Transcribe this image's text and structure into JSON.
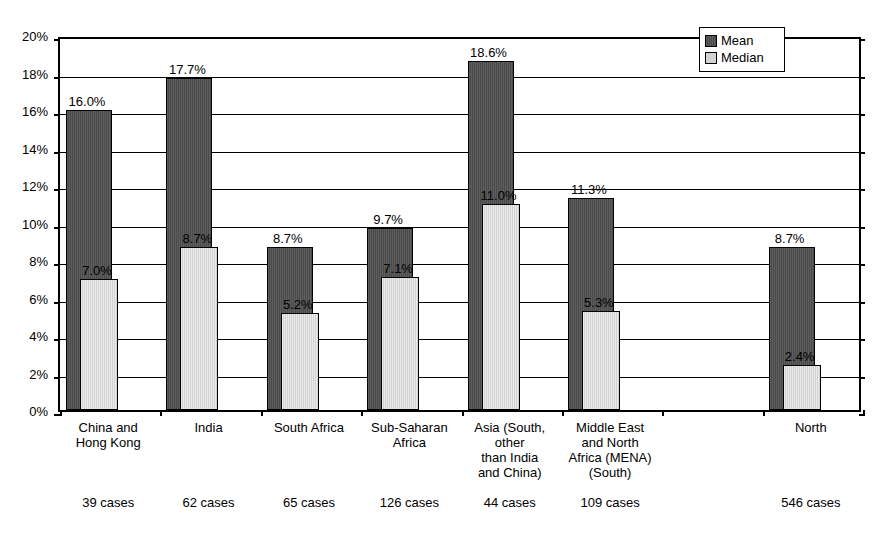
{
  "chart_data": {
    "type": "bar",
    "title": "",
    "xlabel": "",
    "ylabel": "",
    "ylim": [
      0,
      20
    ],
    "ytick_labels": [
      "0%",
      "2%",
      "4%",
      "6%",
      "8%",
      "10%",
      "12%",
      "14%",
      "16%",
      "18%",
      "20%"
    ],
    "ytick_values": [
      0,
      2,
      4,
      6,
      8,
      10,
      12,
      14,
      16,
      18,
      20
    ],
    "grid": true,
    "legend_position": "top-right",
    "categories": [
      "China and\nHong Kong",
      "India",
      "South Africa",
      "Sub-Saharan\nAfrica",
      "Asia (South,\nother\nthan India\nand China)",
      "Middle East\nand North\nAfrica (MENA)\n(South)",
      "",
      "North"
    ],
    "category_notes": [
      "39 cases",
      "62 cases",
      "65 cases",
      "126 cases",
      "44 cases",
      "109 cases",
      "",
      "546 cases"
    ],
    "series": [
      {
        "name": "Mean",
        "color": "#4b4b4b",
        "values": [
          16.0,
          17.7,
          8.7,
          9.7,
          18.6,
          11.3,
          null,
          8.7
        ],
        "labels": [
          "16.0%",
          "17.7%",
          "8.7%",
          "9.7%",
          "18.6%",
          "11.3%",
          "",
          "8.7%"
        ]
      },
      {
        "name": "Median",
        "color": "#d2d2d2",
        "values": [
          7.0,
          8.7,
          5.2,
          7.1,
          11.0,
          5.3,
          null,
          2.4
        ],
        "labels": [
          "7.0%",
          "8.7%",
          "5.2%",
          "7.1%",
          "11.0%",
          "5.3%",
          "",
          "2.4%"
        ]
      }
    ]
  },
  "legend": {
    "items": [
      {
        "label": "Mean",
        "swatch": "mean"
      },
      {
        "label": "Median",
        "swatch": "median"
      }
    ]
  }
}
